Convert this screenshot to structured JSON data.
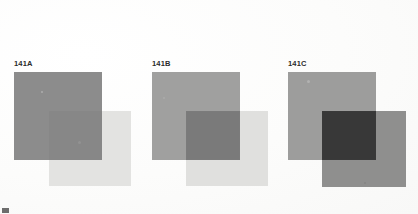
{
  "page": {
    "background_color": "#fdfdfc",
    "width": 418,
    "height": 214,
    "corner_mark_color": "#6d6d6d"
  },
  "chart_data": {
    "type": "table",
    "categories": [
      "141A",
      "141B",
      "141C"
    ],
    "columns": [
      "plate",
      "base_square_value",
      "overlay_square_value",
      "intersection_value"
    ],
    "rows": [
      {
        "plate": "141A",
        "base_square_value": "#8c8c8c",
        "overlay_square_value": "#e3e3e1",
        "intersection_value": "#878787"
      },
      {
        "plate": "141B",
        "base_square_value": "#a0a09f",
        "overlay_square_value": "#e0e0de",
        "intersection_value": "#7a7a7a"
      },
      {
        "plate": "141C",
        "base_square_value": "#9d9d9c",
        "overlay_square_value": "#8f8f8e",
        "intersection_value": "#383838"
      }
    ]
  },
  "plates": [
    {
      "id": "141A",
      "label": "141A",
      "label_x": 14,
      "label_y": 60,
      "base": {
        "x": 14,
        "y": 72,
        "w": 88,
        "h": 88,
        "color": "#8c8c8c"
      },
      "overlay": {
        "x": 49,
        "y": 111,
        "w": 82,
        "h": 75,
        "color": "#e3e3e1"
      },
      "intersection": {
        "x": 49,
        "y": 111,
        "w": 53,
        "h": 49,
        "color": "#878787"
      },
      "blemishes": [
        {
          "x": 41,
          "y": 91,
          "size": 2,
          "color": "#c9c9c9"
        },
        {
          "x": 78,
          "y": 141,
          "size": 3,
          "color": "#9b9b9b"
        }
      ]
    },
    {
      "id": "141B",
      "label": "141B",
      "label_x": 152,
      "label_y": 60,
      "base": {
        "x": 152,
        "y": 72,
        "w": 88,
        "h": 88,
        "color": "#a0a09f"
      },
      "overlay": {
        "x": 186,
        "y": 111,
        "w": 82,
        "h": 75,
        "color": "#e0e0de"
      },
      "intersection": {
        "x": 186,
        "y": 111,
        "w": 54,
        "h": 49,
        "color": "#7a7a7a"
      },
      "blemishes": [
        {
          "x": 163,
          "y": 97,
          "size": 2,
          "color": "#b4b4b4"
        }
      ]
    },
    {
      "id": "141C",
      "label": "141C",
      "label_x": 288,
      "label_y": 60,
      "base": {
        "x": 288,
        "y": 72,
        "w": 88,
        "h": 88,
        "color": "#9d9d9c"
      },
      "overlay": {
        "x": 322,
        "y": 111,
        "w": 84,
        "h": 76,
        "color": "#8f8f8e"
      },
      "intersection": {
        "x": 322,
        "y": 111,
        "w": 54,
        "h": 49,
        "color": "#383838"
      },
      "blemishes": [
        {
          "x": 307,
          "y": 80,
          "size": 3,
          "color": "#c2c2c2"
        },
        {
          "x": 364,
          "y": 182,
          "size": 2,
          "color": "#7c7c7c"
        }
      ]
    }
  ]
}
